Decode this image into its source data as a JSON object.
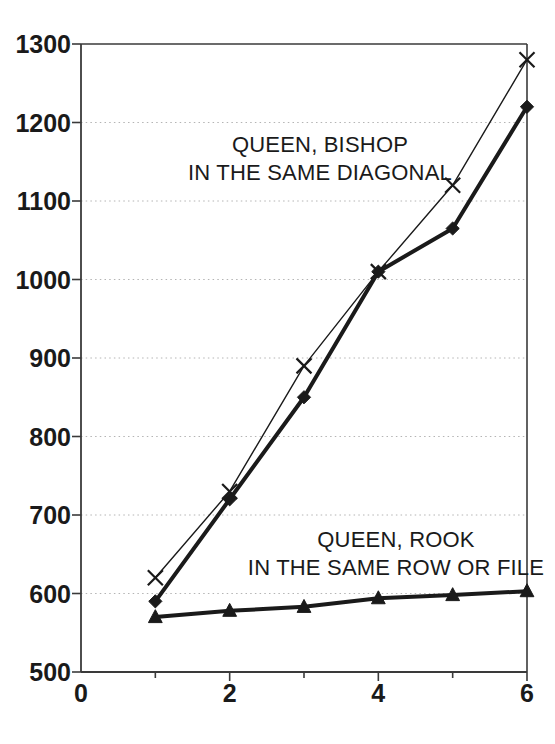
{
  "chart_data": {
    "type": "line",
    "title": "",
    "subtitle": "",
    "xlabel": "",
    "ylabel": "",
    "xlim": [
      0,
      6
    ],
    "ylim": [
      500,
      1300
    ],
    "x_ticks": [
      0,
      2,
      4,
      6
    ],
    "x_tick_labels": [
      "0",
      "2",
      "4",
      "6"
    ],
    "x_minor_ticks": [
      1,
      2,
      3,
      4,
      5,
      6
    ],
    "y_ticks": [
      500,
      600,
      700,
      800,
      900,
      1000,
      1100,
      1200,
      1300
    ],
    "y_tick_labels": [
      "500",
      "600",
      "700",
      "800",
      "900",
      "1000",
      "1100",
      "1200",
      "1300"
    ],
    "grid": "horizontal-dotted",
    "grid_color": "#b4b4b4",
    "legend_position": "inline-annotation",
    "x": [
      1,
      2,
      3,
      4,
      5,
      6
    ],
    "series": [
      {
        "name": "queen-bishop-same-diagonal",
        "label": "QUEEN, BISHOP IN THE SAME DIAGONAL",
        "marker": "cross",
        "color": "#1a1a1a",
        "line_width": 1.4,
        "values": [
          620,
          730,
          890,
          1010,
          1120,
          1280
        ]
      },
      {
        "name": "queen-diamond-series",
        "label": "",
        "marker": "diamond",
        "color": "#1a1a1a",
        "line_width": 4.0,
        "values": [
          590,
          720,
          850,
          1010,
          1065,
          1220
        ]
      },
      {
        "name": "queen-rook-same-row-or-file",
        "label": "QUEEN, ROOK IN THE SAME ROW OR FILE",
        "marker": "triangle",
        "color": "#1a1a1a",
        "line_width": 4.0,
        "values": [
          570,
          578,
          583,
          594,
          598,
          603
        ]
      }
    ],
    "annotations": [
      {
        "name": "annotation-queen-bishop",
        "lines": [
          "QUEEN, BISHOP",
          "IN THE SAME DIAGONAL"
        ],
        "x_px": 320,
        "y_px": 152
      },
      {
        "name": "annotation-queen-rook",
        "lines": [
          "QUEEN, ROOK",
          "IN THE SAME ROW OR FILE"
        ],
        "x_px": 396,
        "y_px": 547
      }
    ],
    "axis_color": "#3a3a3a"
  },
  "annotations": {
    "bishop": {
      "line1": "QUEEN, BISHOP",
      "line2": "IN THE SAME DIAGONAL"
    },
    "rook": {
      "line1": "QUEEN, ROOK",
      "line2": "IN THE SAME ROW OR FILE"
    }
  },
  "y_axis": {
    "t0": "1300",
    "t1": "1200",
    "t2": "1100",
    "t3": "1000",
    "t4": "900",
    "t5": "800",
    "t6": "700",
    "t7": "600",
    "t8": "500"
  },
  "x_axis": {
    "t0": "0",
    "t1": "2",
    "t2": "4",
    "t3": "6"
  }
}
